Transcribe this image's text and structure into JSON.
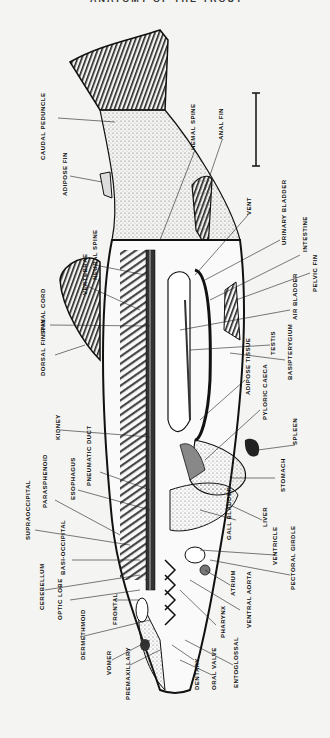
{
  "header": {
    "text": "ANATOMY OF THE TROUT"
  },
  "figure": {
    "scale_bar": "scale-bar",
    "labels": {
      "caudal_peduncle": "CAUDAL PEDUNCLE",
      "adipose_fin": "ADIPOSE FIN",
      "hemal_spine": "HEMAL SPINE",
      "anal_fin": "ANAL FIN",
      "vent": "VENT",
      "urinary_bladder": "URINARY BLADDER",
      "intestine": "INTESTINE",
      "pelvic_fin": "PELVIC FIN",
      "air_bladder": "AIR BLADDER",
      "testis": "TESTIS",
      "basipterygium": "BASIPTERYGIUM",
      "adipose_tissue": "ADIPOSE TISSUE",
      "pyloric_caeca": "PYLORIC CAECA",
      "spleen": "SPLEEN",
      "stomach": "STOMACH",
      "liver": "LIVER",
      "gall_bladder": "GALL BLADDER",
      "ventricle": "VENTRICLE",
      "pectoral_girdle": "PECTORAL GIRDLE",
      "atrium": "ATRIUM",
      "ventral_aorta": "VENTRAL AORTA",
      "pharynx": "PHARYNX",
      "entoglossal": "ENTOGLOSSAL",
      "oral_valve": "ORAL VALVE",
      "dentary": "DENTARY",
      "premaxillary": "PREMAXILLARY",
      "vomer": "VOMER",
      "dermethmoid": "DERMETHMOID",
      "frontal": "FRONTAL",
      "optic_lobe": "OPTIC LOBE",
      "cerebellum": "CEREBELLUM",
      "basioccipital": "BASI-OCCIPITAL",
      "supraoccipital": "SUPRAOCCIPITAL",
      "parasphenoid": "PARASPHENOID",
      "esophagus": "ESOPHAGUS",
      "pneumatic_duct": "PNEUMATIC DUCT",
      "kidney": "KIDNEY",
      "dorsal_fin_ray": "DORSAL FIN RAY",
      "spinal_cord": "SPINAL CORD",
      "vertebrae": "VERTEBRAE",
      "neural_spine": "NEURAL SPINE"
    }
  }
}
